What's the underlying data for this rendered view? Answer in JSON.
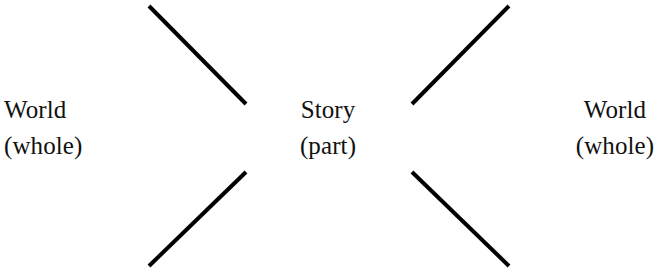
{
  "diagram": {
    "type": "bowtie-narrative-diagram",
    "background_color": "#ffffff",
    "stroke_color": "#000000",
    "stroke_width": 4,
    "labels": {
      "left": {
        "line1": "World",
        "line2": "(whole)"
      },
      "center": {
        "line1": "Story",
        "line2": "(part)"
      },
      "right": {
        "line1": "World",
        "line2": "(whole)"
      }
    },
    "connectors": [
      {
        "name": "top-left-converging-line",
        "x1": 149,
        "y1": 6,
        "x2": 246,
        "y2": 104
      },
      {
        "name": "bottom-left-converging-line",
        "x1": 149,
        "y1": 266,
        "x2": 246,
        "y2": 172
      },
      {
        "name": "top-right-converging-line",
        "x1": 509,
        "y1": 6,
        "x2": 412,
        "y2": 104
      },
      {
        "name": "bottom-right-converging-line",
        "x1": 509,
        "y1": 266,
        "x2": 412,
        "y2": 172
      }
    ]
  }
}
